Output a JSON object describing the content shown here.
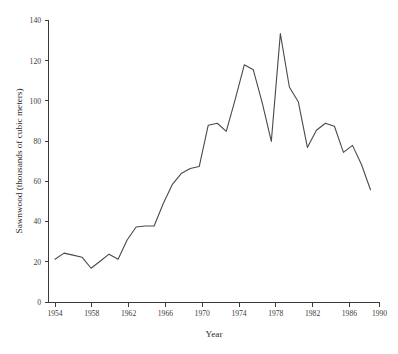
{
  "chart_data": {
    "type": "line",
    "title": "",
    "xlabel": "Year",
    "ylabel": "Sawnwood (thousands of cubic meters)",
    "xlim": [
      1954,
      1990
    ],
    "ylim": [
      0,
      140
    ],
    "xticks": [
      1954,
      1958,
      1962,
      1966,
      1970,
      1974,
      1978,
      1982,
      1986,
      1990
    ],
    "yticks": [
      0,
      20,
      40,
      60,
      80,
      100,
      120,
      140
    ],
    "grid": false,
    "legend": false,
    "legend_position": "none",
    "line_color": "#4a4a4a",
    "x": [
      1954,
      1955,
      1956,
      1957,
      1958,
      1959,
      1960,
      1961,
      1962,
      1963,
      1964,
      1965,
      1966,
      1967,
      1968,
      1969,
      1970,
      1971,
      1972,
      1973,
      1974,
      1975,
      1976,
      1977,
      1978,
      1979,
      1980,
      1981,
      1982,
      1983,
      1984,
      1985,
      1986,
      1987,
      1988,
      1989
    ],
    "values": [
      21.5,
      24.5,
      23.5,
      22.5,
      17.0,
      20.5,
      24.0,
      21.5,
      31.0,
      37.5,
      38.0,
      38.0,
      49.0,
      58.5,
      64.0,
      66.5,
      67.5,
      88.0,
      89.0,
      85.0,
      101.0,
      118.0,
      115.5,
      99.0,
      80.0,
      133.5,
      107.0,
      99.5,
      77.0,
      85.5,
      89.0,
      87.5,
      74.5,
      78.0,
      68.5,
      56.0
    ],
    "series": [
      {
        "name": "Sawnwood",
        "values": [
          21.5,
          24.5,
          23.5,
          22.5,
          17.0,
          20.5,
          24.0,
          21.5,
          31.0,
          37.5,
          38.0,
          38.0,
          49.0,
          58.5,
          64.0,
          66.5,
          67.5,
          88.0,
          89.0,
          85.0,
          101.0,
          118.0,
          115.5,
          99.0,
          80.0,
          133.5,
          107.0,
          99.5,
          77.0,
          85.5,
          89.0,
          87.5,
          74.5,
          78.0,
          68.5,
          56.0
        ]
      }
    ]
  },
  "axes": {
    "y_title": "Sawnwood (thousands of cubic meters)",
    "x_title": "Year",
    "y_tick_labels": [
      "140",
      "120",
      "100",
      "80",
      "60",
      "40",
      "20",
      "0"
    ],
    "x_tick_labels": [
      "1954",
      "1958",
      "1962",
      "1966",
      "1970",
      "1974",
      "1978",
      "1982",
      "1986",
      "1990"
    ]
  },
  "caption": {
    "text": ""
  }
}
